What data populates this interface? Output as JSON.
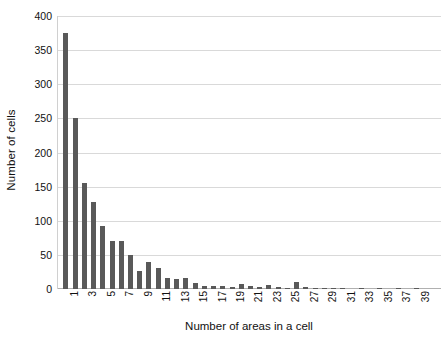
{
  "chart_data": {
    "type": "bar",
    "title": "",
    "xlabel": "Number of areas in a cell",
    "ylabel": "Number of cells",
    "xlim": [
      0,
      41
    ],
    "ylim": [
      0,
      400
    ],
    "grid": true,
    "legend": false,
    "bar_color": "#595959",
    "gridline_color": "#d9d9d9",
    "background": "#ffffff",
    "ytick_labels": [
      "0",
      "50",
      "100",
      "150",
      "200",
      "250",
      "300",
      "350",
      "400"
    ],
    "ytick_values": [
      0,
      50,
      100,
      150,
      200,
      250,
      300,
      350,
      400
    ],
    "xtick_labels": [
      "1",
      "3",
      "5",
      "7",
      "9",
      "11",
      "13",
      "15",
      "17",
      "19",
      "21",
      "23",
      "25",
      "27",
      "29",
      "31",
      "33",
      "35",
      "37",
      "39"
    ],
    "xtick_values": [
      1,
      3,
      5,
      7,
      9,
      11,
      13,
      15,
      17,
      19,
      21,
      23,
      25,
      27,
      29,
      31,
      33,
      35,
      37,
      39
    ],
    "categories": [
      1,
      2,
      3,
      4,
      5,
      6,
      7,
      8,
      9,
      10,
      11,
      12,
      13,
      14,
      15,
      16,
      17,
      18,
      19,
      20,
      21,
      22,
      23,
      24,
      25,
      26,
      27,
      28,
      29,
      30,
      31,
      32,
      33,
      34,
      35,
      36,
      37,
      38,
      39,
      40
    ],
    "values": [
      375,
      250,
      155,
      128,
      92,
      71,
      71,
      50,
      26,
      39,
      31,
      16,
      15,
      16,
      9,
      5,
      5,
      4,
      3,
      7,
      4,
      3,
      6,
      3,
      2,
      11,
      3,
      2,
      1,
      1,
      1,
      0,
      1,
      0,
      1,
      0,
      1,
      0,
      1,
      0
    ]
  }
}
